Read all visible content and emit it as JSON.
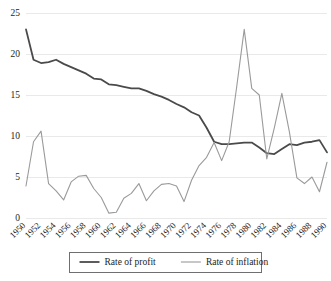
{
  "chart_data": {
    "type": "line",
    "title": "",
    "subtitle": "",
    "xlabel": "",
    "ylabel": "",
    "xlim": [
      1950,
      1990
    ],
    "ylim": [
      0,
      25
    ],
    "grid": "horizontal",
    "legend_position": "bottom",
    "x": [
      1950,
      1951,
      1952,
      1953,
      1954,
      1955,
      1956,
      1957,
      1958,
      1959,
      1960,
      1961,
      1962,
      1963,
      1964,
      1965,
      1966,
      1967,
      1968,
      1969,
      1970,
      1971,
      1972,
      1973,
      1974,
      1975,
      1976,
      1977,
      1978,
      1979,
      1980,
      1981,
      1982,
      1983,
      1984,
      1985,
      1986,
      1987,
      1988,
      1989,
      1990
    ],
    "x_tick_labels": [
      "1950",
      "1952",
      "1954",
      "1956",
      "1958",
      "1960",
      "1962",
      "1964",
      "1966",
      "1968",
      "1970",
      "1972",
      "1974",
      "1976",
      "1978",
      "1980",
      "1982",
      "1984",
      "1986",
      "1988",
      "1990"
    ],
    "y_tick_labels": [
      "0",
      "5",
      "10",
      "15",
      "20",
      "25"
    ],
    "y_ticks": [
      0,
      5,
      10,
      15,
      20,
      25
    ],
    "series": [
      {
        "name": "Rate of profit",
        "color": "#4a4a4a",
        "width": 1.8,
        "values": [
          23.0,
          19.3,
          18.9,
          19.0,
          19.3,
          18.8,
          18.4,
          18.0,
          17.6,
          17.0,
          16.9,
          16.3,
          16.2,
          16.0,
          15.8,
          15.8,
          15.5,
          15.1,
          14.8,
          14.4,
          13.9,
          13.5,
          12.9,
          12.5,
          11.0,
          9.3,
          9.0,
          9.0,
          9.1,
          9.2,
          9.2,
          8.6,
          7.9,
          7.8,
          8.4,
          9.0,
          8.9,
          9.2,
          9.3,
          9.5,
          8.0
        ]
      },
      {
        "name": "Rate of inflation",
        "color": "#9a9a9a",
        "width": 1.1,
        "values": [
          3.9,
          9.3,
          10.6,
          4.2,
          3.3,
          2.2,
          4.4,
          5.1,
          5.2,
          3.6,
          2.5,
          0.6,
          0.7,
          2.4,
          3.0,
          4.2,
          2.1,
          3.3,
          4.1,
          4.2,
          3.9,
          2.0,
          4.6,
          6.4,
          7.4,
          9.2,
          7.0,
          9.3,
          16.0,
          23.0,
          15.8,
          15.0,
          7.2,
          11.0,
          15.2,
          10.5,
          4.9,
          4.2,
          5.0,
          3.2,
          6.8
        ]
      }
    ],
    "legend": [
      {
        "label": "Rate of profit",
        "color": "#4a4a4a",
        "width": 1.8
      },
      {
        "label": "Rate of inflation",
        "color": "#9a9a9a",
        "width": 1.1
      }
    ]
  }
}
